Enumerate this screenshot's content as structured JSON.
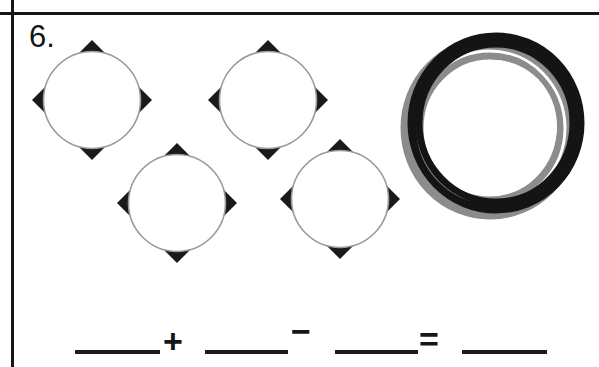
{
  "worksheet": {
    "problem_number": "6.",
    "page_rules": {
      "vertical_rule": "vertical-margin-rule",
      "horizontal_rule": "horizontal-top-rule"
    }
  },
  "shapes": {
    "diamond_circle_count": 4,
    "ring_count": 1,
    "items": [
      {
        "id": "shape-1",
        "kind": "diamond-circle",
        "cx": 92,
        "cy": 100,
        "r": 60,
        "label": "diamond with circle"
      },
      {
        "id": "shape-2",
        "kind": "diamond-circle",
        "cx": 268,
        "cy": 100,
        "r": 60,
        "label": "diamond with circle"
      },
      {
        "id": "shape-3",
        "kind": "diamond-circle",
        "cx": 177,
        "cy": 203,
        "r": 60,
        "label": "diamond with circle"
      },
      {
        "id": "shape-4",
        "kind": "diamond-circle",
        "cx": 340,
        "cy": 199,
        "r": 60,
        "label": "diamond with circle"
      },
      {
        "id": "shape-5",
        "kind": "ring",
        "cx": 492,
        "cy": 124,
        "r": 88,
        "label": "ring"
      }
    ]
  },
  "equation": {
    "expression": "____ + ____ − ____ = ____",
    "operators": {
      "plus": "+",
      "minus": "−",
      "equals": "="
    },
    "blanks": [
      {
        "id": "blank-1",
        "value": ""
      },
      {
        "id": "blank-2",
        "value": ""
      },
      {
        "id": "blank-3",
        "value": ""
      },
      {
        "id": "blank-4",
        "value": ""
      }
    ]
  },
  "colors": {
    "ink": "#161616",
    "black_fill": "#1a1a1a",
    "gray_ring": "#8c8c8c",
    "circle_outline": "#9a9a9a",
    "paper": "#ffffff"
  }
}
